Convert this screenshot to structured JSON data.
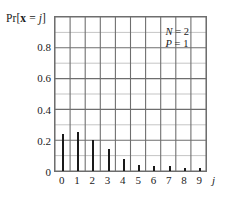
{
  "chart_data": {
    "type": "bar",
    "title": "",
    "subtitle": "",
    "ylabel_parts": {
      "prefix": "Pr[",
      "variable": "x",
      "middle": " = ",
      "index": "j",
      "suffix": "]"
    },
    "ylabel": "Pr[x = j]",
    "xlabel": "j",
    "categories": [
      0,
      1,
      2,
      3,
      4,
      5,
      6,
      7,
      8,
      9
    ],
    "xtick_labels": [
      "0",
      "1",
      "2",
      "3",
      "4",
      "5",
      "6",
      "7",
      "8",
      "9"
    ],
    "values": [
      0.24,
      0.25,
      0.2,
      0.14,
      0.08,
      0.04,
      0.03,
      0.03,
      0.02,
      0.02
    ],
    "ytick_labels": [
      "0",
      "0.2",
      "0.4",
      "0.6",
      "0.8"
    ],
    "ytick_values": [
      0,
      0.2,
      0.4,
      0.6,
      0.8
    ],
    "ylim": [
      0,
      1.0
    ],
    "xlim": [
      -0.5,
      9.5
    ],
    "grid": true,
    "grid_major_step_y": 0.2,
    "grid_minor_step_y": 0.1,
    "grid_major_step_x": 1,
    "legend_position": "none",
    "annotations": [
      {
        "text": "N = 2",
        "variable": "N",
        "value": "2"
      },
      {
        "text": "P = 1",
        "variable": "P",
        "value": "1"
      }
    ],
    "colors": {
      "bar": "#1a1a1a",
      "grid_major": "#6e6e6e",
      "grid_minor": "#b5b5b5",
      "frame": "#6e6e6e",
      "background": "#ffffff",
      "text": "#1a1a1a"
    }
  },
  "annotation": {
    "line1_var": "N",
    "line1_eq": " = 2",
    "line2_var": "P",
    "line2_eq": " = 1"
  }
}
